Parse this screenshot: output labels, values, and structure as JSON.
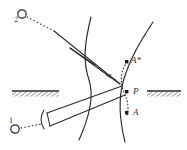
{
  "figure": {
    "type": "line-diagram",
    "background_color": "#fdfdfd",
    "ink_color": "#2a2a2a",
    "width": 187,
    "height": 150,
    "sources": [
      {
        "id": "source-2",
        "label": "2",
        "marker": "open-circle",
        "cx": 22,
        "cy": 14,
        "r": 4.2,
        "label_x": 15,
        "label_y": 19
      },
      {
        "id": "source-1",
        "label": "1",
        "marker": "open-circle",
        "cx": 15,
        "cy": 129,
        "r": 4.2,
        "label_x": 9,
        "label_y": 118
      }
    ],
    "points": [
      {
        "id": "point-a-star",
        "label": "A*",
        "marker": "filled-square",
        "x": 127,
        "y": 62,
        "label_x": 132,
        "label_y": 58
      },
      {
        "id": "point-p",
        "label": "P",
        "marker": "filled-square",
        "x": 127,
        "y": 92,
        "label_x": 133,
        "label_y": 88
      },
      {
        "id": "point-a",
        "label": "A",
        "marker": "filled-square",
        "x": 127,
        "y": 113,
        "label_x": 133,
        "label_y": 109
      }
    ],
    "angle_marks": [
      {
        "id": "angle-l",
        "label": "L",
        "label_x": 110,
        "label_y": 76
      }
    ],
    "ground_lines": [
      {
        "id": "ground-left",
        "x": 12,
        "y": 91,
        "width": 47,
        "height": 5,
        "hatched": true
      },
      {
        "id": "ground-right",
        "x": 147,
        "y": 91,
        "width": 34,
        "height": 5,
        "hatched": true
      }
    ],
    "curves": [
      {
        "id": "wavefront-left",
        "description": "left C-shaped wavefront bowing toward the left",
        "path": "M 91 17 C 84 45, 83 62, 89 80 C 95 98, 88 120, 79 140"
      },
      {
        "id": "wavefront-right",
        "description": "right C-shaped wavefront bowing toward the left",
        "path": "M 153 22 C 140 42, 130 58, 123 82 C 118 101, 120 122, 125 142"
      }
    ],
    "dotted_paths": [
      {
        "id": "ray-2-dotted",
        "description": "dotted segment from source 2 toward the ray",
        "x1": 27,
        "y1": 17,
        "x2": 54,
        "y2": 31
      },
      {
        "id": "ray-1-dotted",
        "description": "dotted segment from source 1 toward the beam aperture",
        "x1": 21,
        "y1": 128,
        "x2": 42,
        "y2": 124
      },
      {
        "id": "image-arc-dotted",
        "description": "dotted arc through A*, P and A",
        "path": "M 127 62 C 121 72, 121 82, 124 92 C 127 101, 129 107, 127 114"
      }
    ],
    "solid_rays": [
      {
        "id": "ray-upper-incident",
        "x1": 54,
        "y1": 31,
        "x2": 120,
        "y2": 84
      },
      {
        "id": "ray-upper-return",
        "x1": 120,
        "y1": 84,
        "x2": 70,
        "y2": 48
      },
      {
        "id": "ray-wavefront-tail-top",
        "x1": 70,
        "y1": 48,
        "x2": 93,
        "y2": 63
      },
      {
        "id": "beam-edge-upper",
        "x1": 47,
        "y1": 113,
        "x2": 122,
        "y2": 86
      },
      {
        "id": "beam-edge-lower",
        "x1": 50,
        "y1": 126,
        "x2": 125,
        "y2": 95
      },
      {
        "id": "beam-end-cap",
        "x1": 47,
        "y1": 113,
        "x2": 50,
        "y2": 126
      },
      {
        "id": "aperture-bracket",
        "path": "M 44 111 C 40 117, 40 122, 44 128"
      }
    ]
  }
}
